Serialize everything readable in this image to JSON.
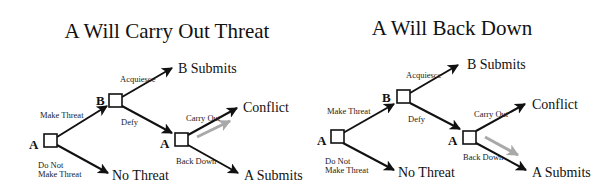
{
  "diagrams": [
    {
      "title": "A Will Carry Out Threat",
      "players": {
        "root": "A",
        "second": "B",
        "third": "A"
      },
      "actions": {
        "make_threat": "Make Threat",
        "do_not_line1": "Do Not",
        "do_not_line2": "Make Threat",
        "acquiesce": "Acquiesce",
        "defy": "Defy",
        "carry_out": "Carry Out",
        "back_down": "Back Down"
      },
      "outcomes": {
        "b_submits": "B Submits",
        "no_threat": "No Threat",
        "conflict": "Conflict",
        "a_submits": "A Submits"
      },
      "highlighted_choice": "Carry Out",
      "highlight_color": "#a9a9a9"
    },
    {
      "title": "A Will Back Down",
      "players": {
        "root": "A",
        "second": "B",
        "third": "A"
      },
      "actions": {
        "make_threat": "Make Threat",
        "do_not_line1": "Do Not",
        "do_not_line2": "Make Threat",
        "acquiesce": "Acquiesce",
        "defy": "Defy",
        "carry_out": "Carry Out",
        "back_down": "Back Down"
      },
      "outcomes": {
        "b_submits": "B Submits",
        "no_threat": "No Threat",
        "conflict": "Conflict",
        "a_submits": "A Submits"
      },
      "highlighted_choice": "Back Down",
      "highlight_color": "#a9a9a9"
    }
  ]
}
